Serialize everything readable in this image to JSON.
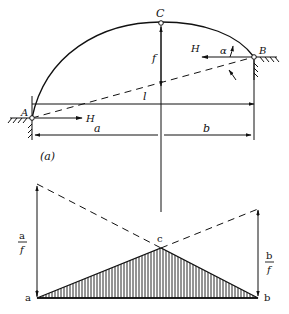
{
  "figure": {
    "caption": "(a)",
    "arch": {
      "points": {
        "A": "A",
        "B": "B",
        "C": "C"
      },
      "dimensions": {
        "rise": "f",
        "span": "l",
        "left_segment": "a",
        "right_segment": "b"
      },
      "forces": {
        "thrust_left": "H",
        "thrust_right": "H"
      },
      "angle": "α"
    },
    "influence_line": {
      "points": {
        "a": "a",
        "b": "b",
        "c": "c"
      },
      "left_ordinate": {
        "num": "a",
        "den": "f"
      },
      "right_ordinate": {
        "num": "b",
        "den": "f"
      }
    }
  },
  "colors": {
    "ink": "#111111",
    "background": "#ffffff"
  }
}
